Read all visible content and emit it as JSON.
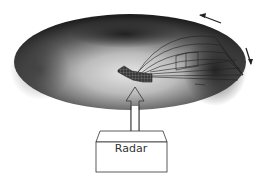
{
  "diagram": {
    "radar_box": {
      "label": "Radar"
    },
    "colors": {
      "ellipsoid_dark": "#2a2a2a",
      "ellipsoid_light": "#d8d8d8",
      "line": "#222222",
      "box_fill": "#ffffff"
    },
    "elements": [
      "ellipsoid-volume",
      "antenna-beam-patch",
      "upward-arrow",
      "radar-box",
      "ray-lines",
      "rotation-arrow-top",
      "rotation-arrow-right"
    ]
  }
}
